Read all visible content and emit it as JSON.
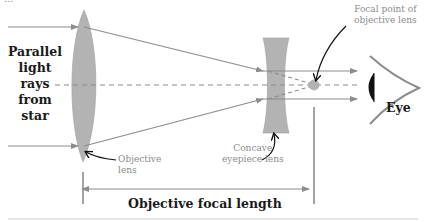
{
  "figure": {
    "clipped_caption": "...",
    "labels": {
      "left": [
        "Parallel",
        "light",
        "rays",
        "from",
        "star"
      ],
      "objective_lens": [
        "Objective",
        "lens"
      ],
      "concave_lens": [
        "Concave",
        "eyepiece lens"
      ],
      "focal_point": [
        "Focal point of",
        "objective lens"
      ],
      "eye": "Eye",
      "focal_length": "Objective focal length"
    },
    "colors": {
      "ray": "#8c8c8c",
      "lens_fill": "#b3b3b3",
      "eye_cornea": "#111111",
      "text_bold": "#1a1a1a",
      "text_light": "#8a8a8a",
      "rule": "#cccccc"
    }
  }
}
